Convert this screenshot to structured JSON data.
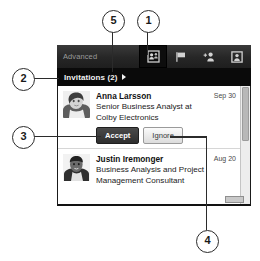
{
  "panel": {
    "toolbar": {
      "advanced_label": "Advanced",
      "icons": [
        {
          "name": "invitations-icon",
          "selected": true
        },
        {
          "name": "flag-icon",
          "selected": false
        },
        {
          "name": "add-person-icon",
          "selected": false
        },
        {
          "name": "profile-frame-icon",
          "selected": false
        }
      ]
    },
    "invitations_header": {
      "label": "Invitations (2)",
      "arrow_icon": "triangle-right-icon",
      "count": 2
    },
    "invitations": [
      {
        "name": "Anna Larsson",
        "headline": "Senior Business Analyst at Colby Electronics",
        "date": "Sep 30",
        "avatar_icon": "avatar-photo-anna",
        "actions": {
          "accept_label": "Accept",
          "ignore_label": "Ignore"
        }
      },
      {
        "name": "Justin Iremonger",
        "headline": "Business Analysis and Project Management Consultant",
        "date": "Aug 20",
        "avatar_icon": "avatar-photo-justin",
        "actions": null
      }
    ]
  },
  "callouts": [
    {
      "id": "1",
      "number": "1"
    },
    {
      "id": "2",
      "number": "2"
    },
    {
      "id": "3",
      "number": "3"
    },
    {
      "id": "4",
      "number": "4"
    },
    {
      "id": "5",
      "number": "5"
    }
  ],
  "colors": {
    "toolbar_dark": "#262626",
    "header_black": "#0a0a0a",
    "accept_button": "#2e2e2e",
    "ignore_button": "#dcdcdc",
    "panel_background": "#ffffff",
    "callout_stroke": "#2b2b2b"
  }
}
